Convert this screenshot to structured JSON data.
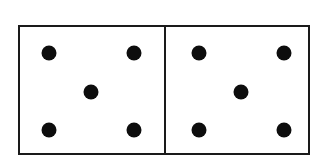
{
  "domino": {
    "description": "Domino tile",
    "halves": [
      {
        "name": "left",
        "value": 5,
        "pips": [
          [
            29,
            26
          ],
          [
            114,
            26
          ],
          [
            71,
            65
          ],
          [
            29,
            103
          ],
          [
            114,
            103
          ]
        ]
      },
      {
        "name": "right",
        "value": 5,
        "pips": [
          [
            33,
            26
          ],
          [
            118,
            26
          ],
          [
            75,
            65
          ],
          [
            33,
            103
          ],
          [
            118,
            103
          ]
        ]
      }
    ]
  },
  "colors": {
    "border": "#1a1a1a",
    "pip": "#0d0d0d",
    "background": "#ffffff"
  }
}
